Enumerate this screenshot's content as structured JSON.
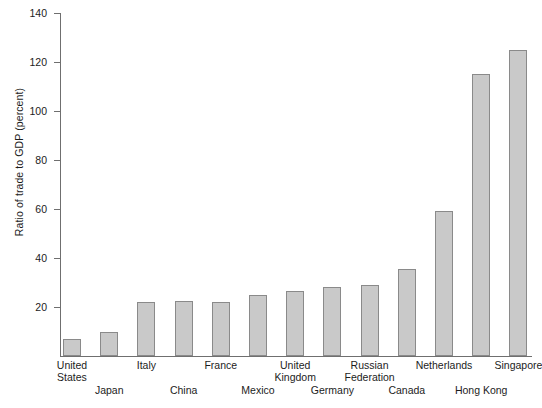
{
  "chart_data": {
    "type": "bar",
    "title": "",
    "xlabel": "",
    "ylabel": "Ratio of trade to GDP (percent)",
    "ylim": [
      0,
      140
    ],
    "yticks": [
      0,
      20,
      40,
      60,
      80,
      100,
      120,
      140
    ],
    "ytick_labels": [
      "",
      "20",
      "40",
      "60",
      "80",
      "100",
      "120",
      "140"
    ],
    "grid": false,
    "legend": null,
    "bar_color": "#c9c9c9",
    "bar_edge_color": "#8a8a8a",
    "axis_color": "#6f6f6f",
    "categories": [
      "United States",
      "Japan",
      "Italy",
      "China",
      "France",
      "Mexico",
      "United Kingdom",
      "Germany",
      "Russian Federation",
      "Canada",
      "Netherlands",
      "Hong Kong",
      "Singapore"
    ],
    "values": [
      7,
      10,
      22,
      22.5,
      22,
      25,
      26.5,
      28,
      29,
      35.5,
      59,
      115,
      125
    ]
  },
  "axis": {
    "y_title": "Ratio of trade to GDP (percent)",
    "ticks": [
      {
        "value": 140,
        "label": "140"
      },
      {
        "value": 120,
        "label": "120"
      },
      {
        "value": 100,
        "label": "100"
      },
      {
        "value": 80,
        "label": "80"
      },
      {
        "value": 60,
        "label": "60"
      },
      {
        "value": 40,
        "label": "40"
      },
      {
        "value": 20,
        "label": "20"
      }
    ]
  },
  "bars": [
    {
      "label": "United States",
      "label_line1": "United",
      "label_line2": "States",
      "value": 7,
      "row": "top"
    },
    {
      "label": "Japan",
      "label_line1": "Japan",
      "label_line2": "",
      "value": 10,
      "row": "bottom"
    },
    {
      "label": "Italy",
      "label_line1": "Italy",
      "label_line2": "",
      "value": 22,
      "row": "top"
    },
    {
      "label": "China",
      "label_line1": "China",
      "label_line2": "",
      "value": 22.5,
      "row": "bottom"
    },
    {
      "label": "France",
      "label_line1": "France",
      "label_line2": "",
      "value": 22,
      "row": "top"
    },
    {
      "label": "Mexico",
      "label_line1": "Mexico",
      "label_line2": "",
      "value": 25,
      "row": "bottom"
    },
    {
      "label": "United Kingdom",
      "label_line1": "United",
      "label_line2": "Kingdom",
      "value": 26.5,
      "row": "top"
    },
    {
      "label": "Germany",
      "label_line1": "Germany",
      "label_line2": "",
      "value": 28,
      "row": "bottom"
    },
    {
      "label": "Russian Federation",
      "label_line1": "Russian",
      "label_line2": "Federation",
      "value": 29,
      "row": "top"
    },
    {
      "label": "Canada",
      "label_line1": "Canada",
      "label_line2": "",
      "value": 35.5,
      "row": "bottom"
    },
    {
      "label": "Netherlands",
      "label_line1": "Netherlands",
      "label_line2": "",
      "value": 59,
      "row": "top"
    },
    {
      "label": "Hong Kong",
      "label_line1": "Hong Kong",
      "label_line2": "",
      "value": 115,
      "row": "bottom"
    },
    {
      "label": "Singapore",
      "label_line1": "Singapore",
      "label_line2": "",
      "value": 125,
      "row": "top"
    }
  ]
}
